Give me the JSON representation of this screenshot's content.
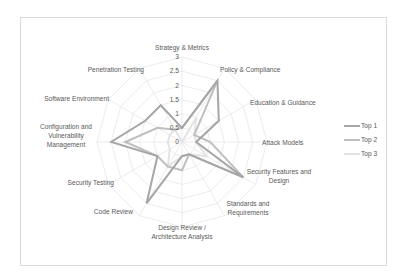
{
  "chart_data": {
    "type": "radar",
    "title": "",
    "categories": [
      "Strategy & Metrics",
      "Policy & Compliance",
      "Education & Guidance",
      "Attack Models",
      "Security Features and Design",
      "Standards and Requirements",
      "Design Review / Architecture Analysis",
      "Code Review",
      "Security Testing",
      "Configuration and Vulnerability Management",
      "Software Environment",
      "Penetration Testing"
    ],
    "category_label_lines": [
      [
        "Strategy & Metrics"
      ],
      [
        "Policy & Compliance"
      ],
      [
        "Education & Guidance"
      ],
      [
        "Attack Models"
      ],
      [
        "Security Features and",
        "Design"
      ],
      [
        "Standards and",
        "Requirements"
      ],
      [
        "Design Review /",
        "Architecture Analysis"
      ],
      [
        "Code Review"
      ],
      [
        "Security Testing"
      ],
      [
        "Configuration and",
        "Vulnerability",
        "Management"
      ],
      [
        "Software Environment"
      ],
      [
        "Penetration Testing"
      ]
    ],
    "series": [
      {
        "name": "Top 1",
        "color": "#a6a6a6",
        "values": [
          0.5,
          2.5,
          1.5,
          0.5,
          2.5,
          0.5,
          0.5,
          2.5,
          1.0,
          2.5,
          1.5,
          1.5
        ]
      },
      {
        "name": "Top 2",
        "color": "#bfbfbf",
        "values": [
          0.5,
          2.5,
          0.5,
          1.0,
          2.5,
          0.5,
          1.0,
          1.0,
          1.0,
          2.0,
          1.0,
          0.5
        ]
      },
      {
        "name": "Top 3",
        "color": "#e3e3e3",
        "values": [
          0.0,
          1.0,
          0.5,
          0.5,
          1.0,
          0.5,
          0.5,
          1.0,
          0.5,
          0.5,
          0.5,
          0.5
        ]
      }
    ],
    "radial_ticks": [
      "0",
      "0.5",
      "1",
      "1.5",
      "2",
      "2.5",
      "3"
    ],
    "rlim": [
      0,
      3
    ],
    "grid": true,
    "legend_position": "right"
  },
  "legend": {
    "items": [
      "Top 1",
      "Top 2",
      "Top 3"
    ]
  }
}
